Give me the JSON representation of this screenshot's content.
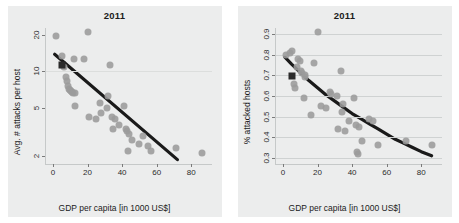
{
  "figure": {
    "panels": [
      {
        "id": "left",
        "title": "2011",
        "xlabel": "GDP per capita [in 1000 US$]",
        "ylabel": "Avg. # attacks per host"
      },
      {
        "id": "right",
        "title": "2011",
        "xlabel": "GDP per capita [in 1000 US$]",
        "ylabel": "% attacked hosts"
      }
    ]
  },
  "chart_data": [
    {
      "type": "scatter",
      "panel": "left",
      "title": "2011",
      "xlabel": "GDP per capita [in 1000 US$]",
      "ylabel": "Avg. # attacks per host",
      "xlim": [
        -4,
        92
      ],
      "ylim": [
        1.7,
        23
      ],
      "yscale": "log",
      "xscale": "linear",
      "grid": "single horizontal gridline at y=10",
      "xticks": [
        0,
        20,
        40,
        60,
        80
      ],
      "yticks": [
        2,
        5,
        10,
        20
      ],
      "legend": "none",
      "series": [
        {
          "name": "countries",
          "marker": "circle",
          "color": "#9b9b9b",
          "points": [
            [
              1.5,
              19.8
            ],
            [
              5.5,
              13.5
            ],
            [
              6.5,
              11.0
            ],
            [
              7.5,
              9.0
            ],
            [
              8.0,
              8.3
            ],
            [
              9.0,
              7.6
            ],
            [
              9.5,
              7.2
            ],
            [
              10.0,
              7.0
            ],
            [
              10.5,
              6.9
            ],
            [
              11.0,
              6.8
            ],
            [
              11.5,
              6.6
            ],
            [
              12.0,
              12.6
            ],
            [
              12.5,
              5.2
            ],
            [
              13.0,
              6.6
            ],
            [
              18.0,
              12.8
            ],
            [
              20.5,
              21.5
            ],
            [
              21.0,
              4.2
            ],
            [
              25.0,
              4.0
            ],
            [
              27.0,
              5.5
            ],
            [
              28.0,
              4.5
            ],
            [
              31.0,
              5.0
            ],
            [
              32.0,
              6.2
            ],
            [
              33.0,
              11.3
            ],
            [
              34.0,
              4.2
            ],
            [
              34.5,
              3.3
            ],
            [
              36.0,
              4.0
            ],
            [
              38.0,
              3.6
            ],
            [
              41.0,
              5.2
            ],
            [
              42.0,
              3.3
            ],
            [
              43.0,
              3.2
            ],
            [
              43.5,
              2.2
            ],
            [
              44.0,
              3.0
            ],
            [
              46.0,
              2.7
            ],
            [
              50.0,
              2.5
            ],
            [
              52.0,
              2.9
            ],
            [
              55.0,
              2.4
            ],
            [
              57.0,
              2.2
            ],
            [
              71.0,
              2.3
            ],
            [
              86.0,
              2.1
            ]
          ]
        },
        {
          "name": "highlighted country",
          "marker": "square",
          "color": "#2b2b2b",
          "points": [
            [
              5.0,
              11.3
            ]
          ]
        }
      ],
      "fit": {
        "name": "linear fit (log y)",
        "type": "line",
        "color": "#1a1a1a",
        "points": [
          [
            1.0,
            13.9
          ],
          [
            72.0,
            1.85
          ]
        ]
      }
    },
    {
      "type": "scatter",
      "panel": "right",
      "title": "2011",
      "xlabel": "GDP per capita [in 1000 US$]",
      "ylabel": "% attacked hosts",
      "xlim": [
        -4,
        92
      ],
      "ylim": [
        0.27,
        0.93
      ],
      "yscale": "linear",
      "xscale": "linear",
      "grid": "horizontal gridlines at every y tick",
      "xticks": [
        0,
        20,
        40,
        60,
        80
      ],
      "yticks": [
        0.3,
        0.4,
        0.5,
        0.6,
        0.7,
        0.8,
        0.9
      ],
      "legend": "none",
      "series": [
        {
          "name": "countries",
          "marker": "circle",
          "color": "#9b9b9b",
          "points": [
            [
              2.0,
              0.8
            ],
            [
              4.0,
              0.81
            ],
            [
              5.0,
              0.82
            ],
            [
              6.5,
              0.66
            ],
            [
              7.0,
              0.64
            ],
            [
              8.0,
              0.74
            ],
            [
              9.0,
              0.78
            ],
            [
              10.0,
              0.77
            ],
            [
              10.5,
              0.72
            ],
            [
              11.0,
              0.71
            ],
            [
              12.0,
              0.59
            ],
            [
              12.5,
              0.7
            ],
            [
              13.0,
              0.69
            ],
            [
              16.0,
              0.51
            ],
            [
              18.0,
              0.76
            ],
            [
              20.5,
              0.91
            ],
            [
              22.0,
              0.55
            ],
            [
              25.0,
              0.54
            ],
            [
              27.0,
              0.62
            ],
            [
              28.0,
              0.61
            ],
            [
              31.0,
              0.6
            ],
            [
              32.0,
              0.44
            ],
            [
              33.5,
              0.72
            ],
            [
              34.0,
              0.52
            ],
            [
              35.0,
              0.56
            ],
            [
              36.0,
              0.43
            ],
            [
              38.0,
              0.48
            ],
            [
              41.0,
              0.59
            ],
            [
              42.0,
              0.46
            ],
            [
              43.0,
              0.33
            ],
            [
              43.5,
              0.32
            ],
            [
              44.0,
              0.45
            ],
            [
              46.0,
              0.38
            ],
            [
              50.0,
              0.49
            ],
            [
              52.0,
              0.48
            ],
            [
              55.0,
              0.36
            ],
            [
              71.0,
              0.38
            ],
            [
              86.0,
              0.36
            ]
          ]
        },
        {
          "name": "highlighted country",
          "marker": "square",
          "color": "#2b2b2b",
          "points": [
            [
              5.5,
              0.695
            ]
          ]
        }
      ],
      "fit": {
        "name": "exponential decay fit",
        "type": "curve",
        "color": "#1a1a1a",
        "points": [
          [
            1.0,
            0.79
          ],
          [
            5.0,
            0.755
          ],
          [
            10.0,
            0.715
          ],
          [
            15.0,
            0.675
          ],
          [
            20.0,
            0.64
          ],
          [
            25.0,
            0.605
          ],
          [
            30.0,
            0.575
          ],
          [
            35.0,
            0.545
          ],
          [
            40.0,
            0.515
          ],
          [
            45.0,
            0.49
          ],
          [
            50.0,
            0.465
          ],
          [
            55.0,
            0.44
          ],
          [
            60.0,
            0.415
          ],
          [
            65.0,
            0.39
          ],
          [
            70.0,
            0.37
          ],
          [
            75.0,
            0.35
          ],
          [
            80.0,
            0.33
          ],
          [
            86.0,
            0.31
          ]
        ]
      }
    }
  ]
}
